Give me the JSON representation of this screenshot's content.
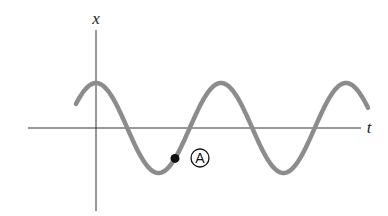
{
  "diagram": {
    "type": "sinusoid_position_vs_time",
    "axes": {
      "vertical_label": "x",
      "horizontal_label": "t",
      "origin_px": [
        96,
        128
      ],
      "h_axis_px": {
        "x1": 28,
        "x2": 361,
        "y": 128
      },
      "v_axis_px": {
        "x": 96,
        "y1": 30,
        "y2": 211
      }
    },
    "curve": {
      "function": "cosine",
      "amplitude_px": 45,
      "period_px": 125,
      "start_x_px": 76,
      "end_x_px": 368,
      "stroke_width": 4.5,
      "color": "#8c8c8c"
    },
    "points": [
      {
        "label": "A",
        "circled_label": "Ⓐ",
        "x_px": 175,
        "y_px": 158,
        "dot_color": "#111111",
        "label_x_px": 200,
        "label_y_px": 158
      }
    ],
    "colors": {
      "axis": "#333333",
      "background": "#ffffff"
    }
  },
  "chart_data": {
    "type": "line",
    "title": "",
    "xlabel": "t",
    "ylabel": "x",
    "series": [
      {
        "name": "x(t)",
        "shape": "cosine",
        "amplitude": 1,
        "period": 1,
        "t_start": -0.16,
        "t_end": 2.18
      }
    ],
    "annotations": [
      {
        "label": "A",
        "t": 0.63,
        "x": -0.67,
        "note": "moving in +x direction, below equilibrium"
      }
    ],
    "grid": false,
    "ticks": "none"
  }
}
